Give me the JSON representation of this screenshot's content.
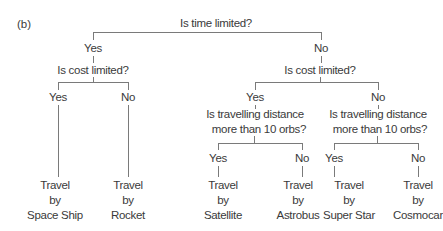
{
  "figure_label": "(b)",
  "root": {
    "question": "Is time limited?",
    "branches": {
      "yes": {
        "label": "Yes",
        "question": "Is cost limited?",
        "branches": {
          "yes": {
            "label": "Yes",
            "leaf": [
              "Travel",
              "by",
              "Space Ship"
            ]
          },
          "no": {
            "label": "No",
            "leaf": [
              "Travel",
              "by",
              "Rocket"
            ]
          }
        }
      },
      "no": {
        "label": "No",
        "question": "Is cost limited?",
        "branches": {
          "yes": {
            "label": "Yes",
            "question": [
              "Is travelling distance",
              "more than 10 orbs?"
            ],
            "branches": {
              "yes": {
                "label": "Yes",
                "leaf": [
                  "Travel",
                  "by",
                  "Satellite"
                ]
              },
              "no": {
                "label": "No",
                "leaf": [
                  "Travel",
                  "by",
                  "Astrobus"
                ]
              }
            }
          },
          "no": {
            "label": "No",
            "question": [
              "Is travelling distance",
              "more than 10 orbs?"
            ],
            "branches": {
              "yes": {
                "label": "Yes",
                "leaf": [
                  "Travel",
                  "by",
                  "Super Star"
                ]
              },
              "no": {
                "label": "No",
                "leaf": [
                  "Travel",
                  "by",
                  "Cosmocar"
                ]
              }
            }
          }
        }
      }
    }
  },
  "colors": {
    "text": "#3a3a3a",
    "line": "#7a7a7a",
    "background": "#ffffff"
  }
}
